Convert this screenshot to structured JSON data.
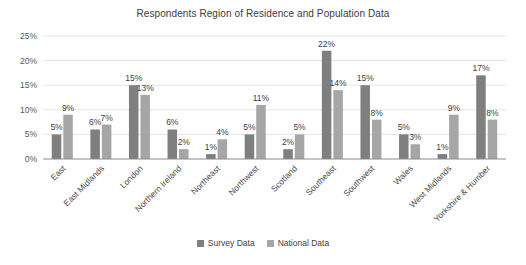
{
  "chart_data": {
    "type": "bar",
    "title": "Respondents Region of Residence and Population Data",
    "categories": [
      "East",
      "East Midlands",
      "London",
      "Northern Ireland",
      "Northeast",
      "Northwest",
      "Scotland",
      "Southeast",
      "Southwest",
      "Wales",
      "West Midlands",
      "Yorkshire & Humber"
    ],
    "series": [
      {
        "name": "Survey Data",
        "color": "#7f7f7f",
        "values": [
          5,
          6,
          15,
          6,
          1,
          5,
          2,
          22,
          15,
          5,
          1,
          17
        ]
      },
      {
        "name": "National Data",
        "color": "#a6a6a6",
        "values": [
          9,
          7,
          13,
          2,
          4,
          11,
          5,
          14,
          8,
          3,
          9,
          8
        ]
      }
    ],
    "value_suffix": "%",
    "data_labels": true,
    "ylim": [
      0,
      25
    ],
    "yticks": [
      0,
      5,
      10,
      15,
      20,
      25
    ],
    "ytick_labels": [
      "0%",
      "5%",
      "10%",
      "15%",
      "20%",
      "25%"
    ],
    "grid": true,
    "legend_position": "bottom",
    "colors": {
      "gridline": "#e5e5e5",
      "axis_line": "#8c8c8c",
      "data_label": "#3d3d3d",
      "tick_label": "#595959",
      "title": "#3b3b3b"
    }
  }
}
